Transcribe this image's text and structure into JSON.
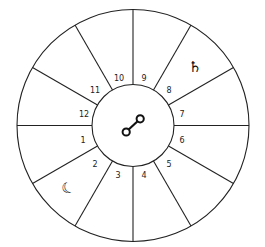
{
  "wheel": {
    "title": "House chart wheel",
    "houses": [
      "1",
      "2",
      "3",
      "4",
      "5",
      "6",
      "7",
      "8",
      "9",
      "10",
      "11",
      "12"
    ],
    "center_symbol": {
      "name": "opposition",
      "glyph": "☍"
    },
    "planets": [
      {
        "name": "saturn",
        "glyph": "♄",
        "house": "8"
      },
      {
        "name": "moon",
        "glyph": "☾",
        "house": "2"
      }
    ],
    "stroke_color": "#222222",
    "background": "#ffffff"
  }
}
